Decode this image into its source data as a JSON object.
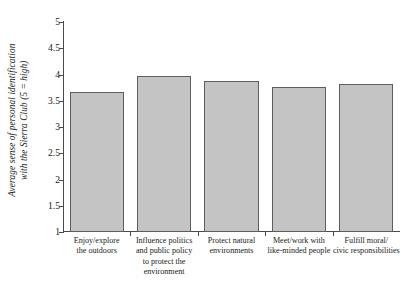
{
  "chart_data": {
    "type": "bar",
    "title": "",
    "subtitle": "",
    "xlabel": "",
    "ylabel": "Average sense of personal identification with the Sierra Club  (5 = high)",
    "ylabel_lines": [
      "Average sense of personal identification",
      "with the Sierra Club  (5 = high)"
    ],
    "categories": [
      "Enjoy/explore the outdoors",
      "Influence politics and public policy to protect the environment",
      "Protect natural environments",
      "Meet/work with like-minded people",
      "Fulfill moral/ civic responsibilities"
    ],
    "category_lines": [
      [
        "Enjoy/explore",
        "the outdoors"
      ],
      [
        "Influence politics",
        "and public policy",
        "to protect the",
        "environment"
      ],
      [
        "Protect natural",
        "environments"
      ],
      [
        "Meet/work with",
        "like-minded people"
      ],
      [
        "Fulfill moral/",
        "civic responsibilities"
      ]
    ],
    "values": [
      3.67,
      3.97,
      3.88,
      3.76,
      3.82
    ],
    "ylim": [
      1,
      5
    ],
    "ytick_values": [
      5,
      4.5,
      4,
      3.5,
      3,
      2.5,
      2,
      1.5,
      1
    ],
    "ytick_labels": [
      "5",
      "4.5",
      "4",
      "3.5",
      "3",
      "2.5",
      "2",
      "1.5",
      "1"
    ],
    "grid": false,
    "legend": false,
    "legend_position": "none",
    "bar_color": "#c4c4c4",
    "bar_edge_color": "#5e5e5e",
    "axis_color": "#4a4a4a",
    "background_color": "#ffffff"
  }
}
